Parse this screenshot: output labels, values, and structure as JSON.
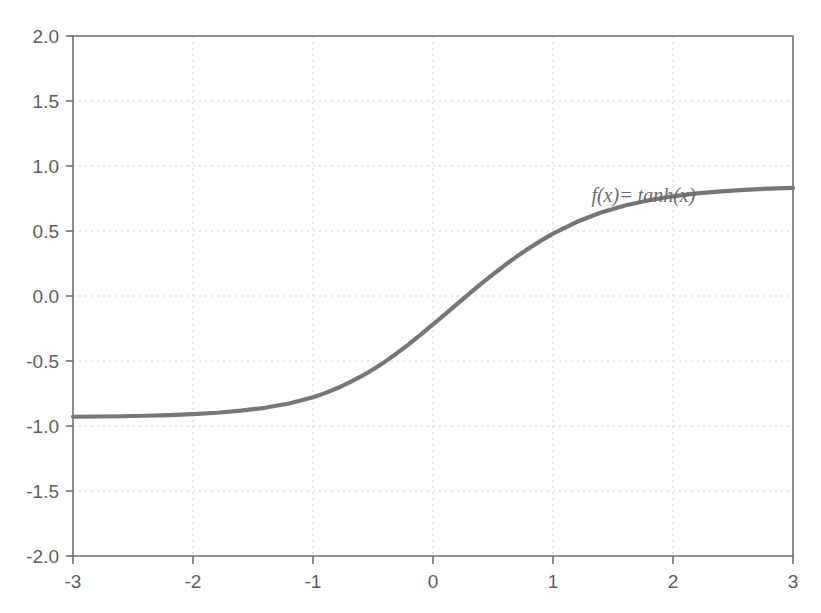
{
  "chart_data": {
    "type": "line",
    "title": "",
    "subtitle": "",
    "xlabel": "",
    "ylabel": "",
    "xlim": [
      -3,
      3
    ],
    "ylim": [
      -2,
      2
    ],
    "grid": true,
    "legend": "none",
    "annotations": [
      {
        "name": "curve-equation-label",
        "text": "f(x)= tanh(x)",
        "x": 1.32,
        "y": 0.72
      }
    ],
    "x_ticks": [
      -3,
      -2,
      -1,
      0,
      1,
      2,
      3
    ],
    "x_tick_labels": [
      "-3",
      "-2",
      "-1",
      "0",
      "1",
      "2",
      "3"
    ],
    "y_ticks": [
      2,
      1.5,
      1,
      0.5,
      0,
      -0.5,
      -1,
      -1.5,
      -2
    ],
    "y_tick_labels": [
      "2.0",
      "1.5",
      "1.0",
      "0.5",
      "0.0",
      "-0.5",
      "-1.0",
      "-1.5",
      "-2.0"
    ],
    "series": [
      {
        "name": "tanh",
        "label": "f(x)= tanh(x)",
        "color": "#76767a",
        "x": [
          -3,
          -2.8,
          -2.6,
          -2.4,
          -2.2,
          -2,
          -1.8,
          -1.6,
          -1.4,
          -1.2,
          -1,
          -0.9,
          -0.8,
          -0.7,
          -0.6,
          -0.5,
          -0.4,
          -0.3,
          -0.2,
          -0.1,
          0,
          0.1,
          0.2,
          0.3,
          0.4,
          0.5,
          0.6,
          0.7,
          0.8,
          0.9,
          1,
          1.2,
          1.4,
          1.6,
          1.8,
          2,
          2.2,
          2.4,
          2.6,
          2.8,
          3
        ],
        "values": [
          -0.929,
          -0.927,
          -0.925,
          -0.921,
          -0.916,
          -0.909,
          -0.898,
          -0.882,
          -0.86,
          -0.827,
          -0.779,
          -0.747,
          -0.71,
          -0.667,
          -0.619,
          -0.565,
          -0.505,
          -0.44,
          -0.37,
          -0.296,
          -0.219,
          -0.141,
          -0.062,
          0.016,
          0.093,
          0.167,
          0.238,
          0.305,
          0.368,
          0.426,
          0.48,
          0.571,
          0.642,
          0.696,
          0.737,
          0.767,
          0.789,
          0.805,
          0.817,
          0.826,
          0.832
        ]
      }
    ]
  },
  "colors": {
    "curve": "#76767a",
    "grid": "#d2d2d6",
    "axis": "#6f6f72",
    "tick_text": "#5e5e60",
    "annotation_text": "#6a6a6c",
    "background": "#ffffff"
  }
}
